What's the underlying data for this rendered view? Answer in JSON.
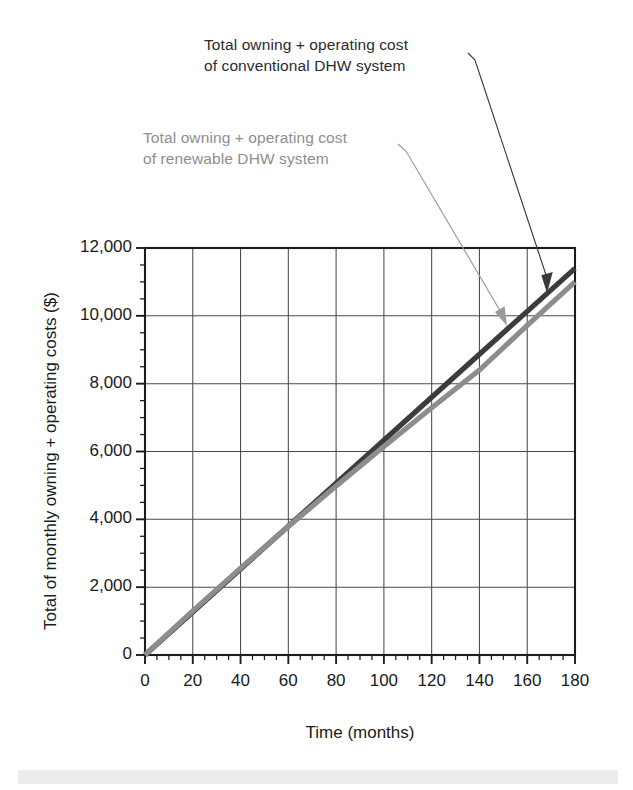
{
  "chart_data": {
    "type": "line",
    "title": "",
    "xlabel": "Time (months)",
    "ylabel": "Total of monthly owning + operating costs ($)",
    "xlim": [
      0,
      180
    ],
    "ylim": [
      0,
      12000
    ],
    "grid": true,
    "legend_position": "annotations-with-leader-lines",
    "x_tick_labels": [
      "0",
      "20",
      "40",
      "60",
      "80",
      "100",
      "120",
      "140",
      "160",
      "180"
    ],
    "x_ticks": [
      0,
      20,
      40,
      60,
      80,
      100,
      120,
      140,
      160,
      180
    ],
    "x_minor_tick_step": 5,
    "y_tick_labels": [
      "0",
      "2,000",
      "4,000",
      "6,000",
      "8,000",
      "10,000",
      "12,000"
    ],
    "y_ticks": [
      0,
      2000,
      4000,
      6000,
      8000,
      10000,
      12000
    ],
    "y_minor_tick_step": 500,
    "x": [
      0,
      20,
      40,
      60,
      80,
      100,
      120,
      140,
      160,
      180
    ],
    "series": [
      {
        "name": "Total owning + operating cost of conventional DHW system",
        "color": "#3c3c3c",
        "values": [
          0,
          1267,
          2533,
          3800,
          5067,
          6333,
          7600,
          8867,
          10133,
          11400
        ]
      },
      {
        "name": "Total owning + operating cost of renewable DHW system",
        "color": "#8d8d8d",
        "values": [
          0,
          1300,
          2560,
          3790,
          4980,
          6150,
          7290,
          8400,
          9720,
          11000
        ]
      }
    ],
    "annotations": [
      {
        "id": "conventional",
        "line1": "Total owning + operating cost",
        "line2": "of conventional DHW system",
        "color": "#2b2b2b",
        "points_to_series": "conventional"
      },
      {
        "id": "renewable",
        "line1": "Total owning + operating cost",
        "line2": "of renewable DHW system",
        "color": "#8e8e8e",
        "points_to_series": "renewable"
      }
    ]
  },
  "axes": {
    "x_title": "Time (months)",
    "y_title": "Total of monthly owning + operating costs ($)"
  },
  "annotations": {
    "conventional": "Total owning + operating cost\nof conventional DHW system",
    "renewable": "Total owning + operating cost\nof renewable DHW system"
  },
  "ticks": {
    "y": [
      "12,000",
      "10,000",
      "8,000",
      "6,000",
      "4,000",
      "2,000",
      "0"
    ],
    "x": [
      "0",
      "20",
      "40",
      "60",
      "80",
      "100",
      "120",
      "140",
      "160",
      "180"
    ]
  },
  "colors": {
    "conventional_line": "#3c3c3c",
    "renewable_line": "#8d8d8d",
    "axis": "#1c1c1c",
    "grid": "#4a4a4a",
    "background": "#ffffff"
  }
}
